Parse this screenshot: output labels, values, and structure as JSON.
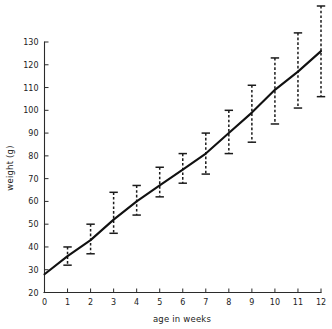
{
  "chart_data": {
    "type": "line",
    "title": "",
    "xlabel": "age in weeks",
    "ylabel": "weight (g)",
    "xlim": [
      0,
      12
    ],
    "ylim": [
      20,
      130
    ],
    "xticks": [
      "0",
      "1",
      "2",
      "3",
      "4",
      "5",
      "6",
      "7",
      "8",
      "9",
      "10",
      "11",
      "12"
    ],
    "yticks": [
      "20",
      "30",
      "40",
      "50",
      "60",
      "70",
      "80",
      "90",
      "100",
      "110",
      "120",
      "130"
    ],
    "grid": false,
    "legend": "none",
    "x": [
      0,
      1,
      2,
      3,
      4,
      5,
      6,
      7,
      8,
      9,
      10,
      11,
      12
    ],
    "values": [
      28,
      36,
      43,
      52,
      60,
      67,
      74,
      81,
      90,
      99,
      109,
      117,
      126
    ],
    "error_bars": {
      "description": "vertical dashed error bars with horizontal caps at each weekly mean",
      "lower": [
        28,
        32,
        37,
        46,
        54,
        62,
        68,
        72,
        81,
        86,
        94,
        101,
        106
      ],
      "upper": [
        28,
        40,
        50,
        64,
        67,
        75,
        81,
        90,
        100,
        111,
        123,
        134,
        146
      ]
    }
  }
}
